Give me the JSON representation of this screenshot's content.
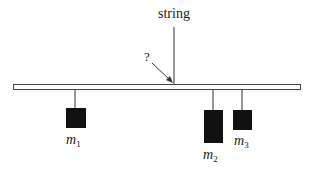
{
  "diagram": {
    "string_label": "string",
    "question_label": "?",
    "masses": [
      {
        "name": "m",
        "subscript": "1"
      },
      {
        "name": "m",
        "subscript": "2"
      },
      {
        "name": "m",
        "subscript": "3"
      }
    ],
    "colors": {
      "line": "#333333",
      "mass_fill": "#111111",
      "bar_fill": "#ffffff"
    }
  }
}
